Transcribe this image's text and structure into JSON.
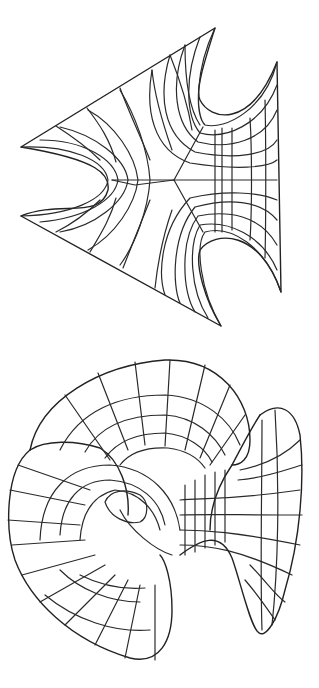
{
  "figures": [
    {
      "id": "top",
      "description": "Wireframe minimal surface, planar projection with three catenoidal ends (trinoid-like)",
      "stroke_color": "#2a2a2a",
      "background": "#ffffff"
    },
    {
      "id": "bottom",
      "description": "Wireframe minimal surface, 3D perspective view with three flared ends",
      "stroke_color": "#2a2a2a",
      "background": "#ffffff"
    }
  ]
}
